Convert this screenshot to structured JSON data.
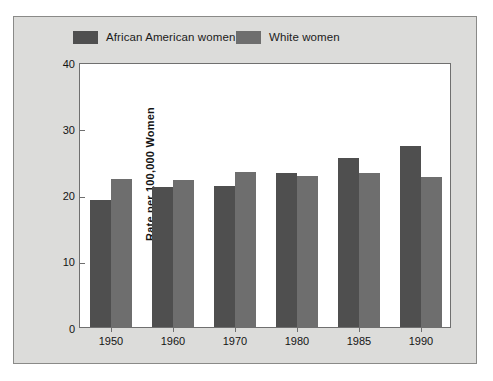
{
  "chart_data": {
    "type": "bar",
    "title": "",
    "subtitle": "",
    "xlabel": "",
    "ylabel": "Rate per 100,000 Women",
    "categories": [
      "1950",
      "1960",
      "1970",
      "1980",
      "1985",
      "1990"
    ],
    "series": [
      {
        "name": "African American women",
        "color": "#4f4f4f",
        "values": [
          19.2,
          21.1,
          21.3,
          23.2,
          25.5,
          27.3
        ]
      },
      {
        "name": "White women",
        "color": "#6e6e6e",
        "values": [
          22.3,
          22.2,
          23.4,
          22.8,
          23.2,
          22.6
        ]
      }
    ],
    "ylim": [
      0,
      40
    ],
    "y_ticks": [
      "0",
      "10",
      "20",
      "30",
      "40"
    ],
    "y_tick_values": [
      0,
      10,
      20,
      30,
      40
    ],
    "grid": false,
    "legend_position": "top"
  },
  "figure": {
    "background_color": "#dcdcda",
    "plot_background_color": "#ffffff",
    "border_color": "#8a8a88",
    "axis_color": "#6f6f6f"
  }
}
